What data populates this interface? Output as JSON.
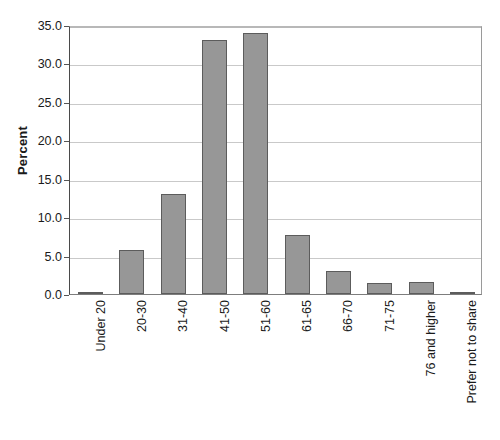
{
  "chart_data": {
    "type": "bar",
    "title": "",
    "xlabel": "",
    "ylabel": "Percent",
    "categories": [
      "Under 20",
      "20-30",
      "31-40",
      "41-50",
      "51-60",
      "61-65",
      "66-70",
      "71-75",
      "76 and higher",
      "Prefer not to share"
    ],
    "values": [
      0.2,
      5.7,
      13.0,
      33.0,
      34.0,
      7.7,
      3.0,
      1.4,
      1.5,
      0.2
    ],
    "ylim": [
      0.0,
      35.0
    ],
    "y_ticks": [
      "0.0",
      "5.0",
      "10.0",
      "15.0",
      "20.0",
      "25.0",
      "30.0",
      "35.0"
    ],
    "y_tick_values": [
      0.0,
      5.0,
      10.0,
      15.0,
      20.0,
      25.0,
      30.0,
      35.0
    ],
    "grid": true,
    "legend": false,
    "legend_position": "none",
    "bar_color": "#979797",
    "bar_border_color": "#5c5c5c",
    "gridline_color": "#c9c9c9",
    "axis_color": "#4a4a4a",
    "background_color": "#ffffff"
  }
}
